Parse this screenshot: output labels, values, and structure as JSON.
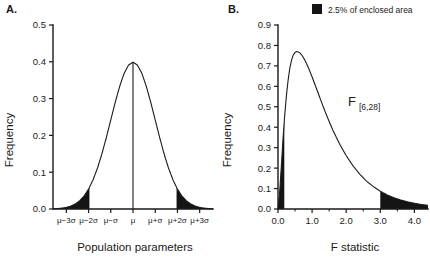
{
  "figure": {
    "background": "#ffffff",
    "ink": "#1a1a1a",
    "fill_color": "#141414"
  },
  "legend": {
    "label": "2.5% of enclosed area",
    "swatch_color": "#141414"
  },
  "panels": [
    {
      "id": "A",
      "label": "A.",
      "annotation": "",
      "annotation_sub": ""
    },
    {
      "id": "B",
      "label": "B.",
      "annotation": "F",
      "annotation_sub": "[6,28]"
    }
  ],
  "chart_data": [
    {
      "type": "area",
      "panel": "A",
      "title": "",
      "distribution": "normal",
      "mean": 0,
      "sd": 1,
      "peak_value": 0.4,
      "xlabel": "Population parameters",
      "ylabel": "Frequency",
      "xlim": [
        -3.6,
        3.6
      ],
      "ylim": [
        0.0,
        0.5
      ],
      "grid": false,
      "x_ticks": [
        -3,
        -2,
        -1,
        0,
        1,
        2,
        3
      ],
      "x_tick_labels": [
        "μ−3σ",
        "μ−2σ",
        "μ−σ",
        "μ",
        "μ+σ",
        "μ+2σ",
        "μ+3σ"
      ],
      "y_ticks": [
        0.0,
        0.1,
        0.2,
        0.3,
        0.4,
        0.5
      ],
      "y_tick_labels": [
        "0.0",
        "0.1",
        "0.2",
        "0.3",
        "0.4",
        "0.5"
      ],
      "shaded_regions": [
        {
          "name": "left-tail",
          "from": -3.6,
          "to": -1.96,
          "area": 0.025
        },
        {
          "name": "right-tail",
          "from": 1.96,
          "to": 3.6,
          "area": 0.025
        }
      ],
      "center_line_x": 0,
      "x": [
        -3.6,
        -3.4,
        -3.2,
        -3.0,
        -2.8,
        -2.6,
        -2.4,
        -2.2,
        -2.0,
        -1.8,
        -1.6,
        -1.4,
        -1.2,
        -1.0,
        -0.8,
        -0.6,
        -0.4,
        -0.2,
        0.0,
        0.2,
        0.4,
        0.6,
        0.8,
        1.0,
        1.2,
        1.4,
        1.6,
        1.8,
        2.0,
        2.2,
        2.4,
        2.6,
        2.8,
        3.0,
        3.2,
        3.4,
        3.6
      ],
      "y": [
        0.0006,
        0.0012,
        0.0024,
        0.0044,
        0.0079,
        0.0136,
        0.0224,
        0.0355,
        0.054,
        0.079,
        0.1109,
        0.1497,
        0.1942,
        0.242,
        0.2897,
        0.3332,
        0.3683,
        0.391,
        0.3989,
        0.391,
        0.3683,
        0.3332,
        0.2897,
        0.242,
        0.1942,
        0.1497,
        0.1109,
        0.079,
        0.054,
        0.0355,
        0.0224,
        0.0136,
        0.0079,
        0.0044,
        0.0024,
        0.0012,
        0.0006
      ]
    },
    {
      "type": "area",
      "panel": "B",
      "title": "",
      "distribution": "F",
      "df1": 6,
      "df2": 28,
      "peak_value": 0.77,
      "peak_x": 0.65,
      "xlabel": "F statistic",
      "ylabel": "Frequency",
      "xlim": [
        0.0,
        4.4
      ],
      "ylim": [
        0.0,
        0.9
      ],
      "grid": false,
      "x_ticks": [
        0.0,
        1.0,
        2.0,
        3.0,
        4.0
      ],
      "x_tick_labels": [
        "0.0",
        "1.0",
        "2.0",
        "3.0",
        "4.0"
      ],
      "x_minor_ticks": [
        0.5,
        1.5,
        2.5,
        3.5
      ],
      "y_ticks": [
        0.0,
        0.1,
        0.2,
        0.3,
        0.4,
        0.5,
        0.6,
        0.7,
        0.8,
        0.9
      ],
      "y_tick_labels": [
        "0.0",
        "0.1",
        "0.2",
        "0.3",
        "0.4",
        "0.5",
        "0.6",
        "0.7",
        "0.8",
        "0.9"
      ],
      "shaded_regions": [
        {
          "name": "left-tail",
          "from": 0.0,
          "to": 0.185,
          "area": 0.025
        },
        {
          "name": "right-tail",
          "from": 3.0,
          "to": 4.4,
          "area": 0.025
        }
      ],
      "x": [
        0.0,
        0.05,
        0.1,
        0.15,
        0.2,
        0.25,
        0.3,
        0.35,
        0.4,
        0.45,
        0.5,
        0.55,
        0.6,
        0.65,
        0.7,
        0.75,
        0.8,
        0.9,
        1.0,
        1.1,
        1.2,
        1.3,
        1.4,
        1.5,
        1.6,
        1.8,
        2.0,
        2.2,
        2.4,
        2.6,
        2.8,
        3.0,
        3.2,
        3.4,
        3.6,
        3.8,
        4.0,
        4.2,
        4.4
      ],
      "y": [
        0.0,
        0.085,
        0.215,
        0.35,
        0.465,
        0.56,
        0.635,
        0.692,
        0.73,
        0.754,
        0.766,
        0.77,
        0.768,
        0.762,
        0.752,
        0.739,
        0.724,
        0.688,
        0.646,
        0.602,
        0.557,
        0.512,
        0.469,
        0.428,
        0.389,
        0.32,
        0.261,
        0.211,
        0.17,
        0.136,
        0.109,
        0.087,
        0.069,
        0.055,
        0.044,
        0.035,
        0.028,
        0.022,
        0.018
      ]
    }
  ]
}
